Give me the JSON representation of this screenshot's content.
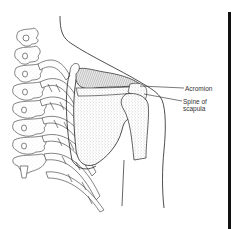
{
  "figure": {
    "labels": [
      {
        "id": "acromion",
        "text": "Acromion"
      },
      {
        "id": "spine-of-scapula",
        "line1": "Spine of",
        "line2": "scapula"
      }
    ]
  },
  "colors": {
    "background": "#ffffff",
    "ink": "#222222",
    "stipple": "#9a9a9a",
    "border": "#111111"
  }
}
